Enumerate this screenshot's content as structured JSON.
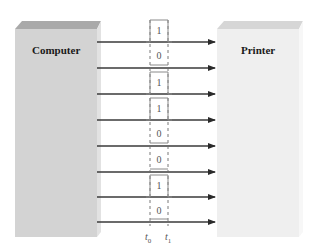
{
  "diagram": {
    "computer": {
      "label": "Computer",
      "front_color": "#d3d3d3",
      "top_color": "#a9a9a9",
      "side_color": "#e0e0e0"
    },
    "printer": {
      "label": "Printer",
      "front_color": "#efefef",
      "top_color": "#d6d6d6",
      "side_color": "#f6f6f6"
    },
    "lines": [
      {
        "bit": "1"
      },
      {
        "bit": "0"
      },
      {
        "bit": "1"
      },
      {
        "bit": "1"
      },
      {
        "bit": "0"
      },
      {
        "bit": "0"
      },
      {
        "bit": "1"
      },
      {
        "bit": "0"
      }
    ],
    "time_labels": {
      "t0": "t",
      "t0_sub": "0",
      "t1": "t",
      "t1_sub": "1"
    },
    "colors": {
      "wire": "#3a3a3a",
      "pulse": "#8a8a8a",
      "dash": "#6a6a6a"
    }
  }
}
